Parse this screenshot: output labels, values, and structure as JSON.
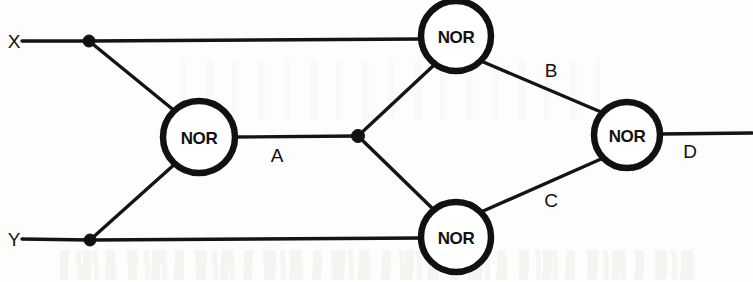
{
  "diagram": {
    "type": "logic-circuit-schematic",
    "colors": {
      "line": "#141414",
      "gate_outline": "#111111",
      "gate_fill": "#ffffff",
      "background": "#fdfdfb",
      "text": "#111111"
    },
    "inputs": [
      {
        "id": "x",
        "label": "X",
        "x": 7,
        "y": 41
      },
      {
        "id": "y",
        "label": "Y",
        "x": 7,
        "y": 239
      }
    ],
    "outputs": [
      {
        "id": "d",
        "label": "D",
        "x": 690,
        "y": 151
      }
    ],
    "gates": [
      {
        "id": "gate1",
        "label": "NOR",
        "cx": 199,
        "cy": 137,
        "r": 36
      },
      {
        "id": "gate2",
        "label": "NOR",
        "cx": 456,
        "cy": 36,
        "r": 35
      },
      {
        "id": "gate3",
        "label": "NOR",
        "cx": 456,
        "cy": 237,
        "r": 35
      },
      {
        "id": "gate4",
        "label": "NOR",
        "cx": 627,
        "cy": 135,
        "r": 33
      }
    ],
    "signal_labels": [
      {
        "id": "a",
        "label": "A",
        "x": 277,
        "y": 155
      },
      {
        "id": "b",
        "label": "B",
        "x": 551,
        "y": 70
      },
      {
        "id": "c",
        "label": "C",
        "x": 551,
        "y": 200
      },
      {
        "id": "d",
        "label": "D",
        "x": 690,
        "y": 151
      }
    ],
    "junctions": [
      {
        "id": "junction-x",
        "cx": 89,
        "cy": 41,
        "r": 6
      },
      {
        "id": "junction-y",
        "cx": 90,
        "cy": 240,
        "r": 6
      },
      {
        "id": "junction-a",
        "cx": 358,
        "cy": 136,
        "r": 6.5
      }
    ],
    "wires": [
      {
        "id": "wire-x-input",
        "d": "M 22 41 L 89 41"
      },
      {
        "id": "wire-x-to-gate2",
        "d": "M 89 41 L 421 39"
      },
      {
        "id": "wire-x-to-gate1",
        "d": "M 89 41 L 176 112"
      },
      {
        "id": "wire-y-input",
        "d": "M 22 239 L 90 240"
      },
      {
        "id": "wire-y-to-gate3",
        "d": "M 90 240 L 424 238"
      },
      {
        "id": "wire-y-to-gate1",
        "d": "M 90 240 L 176 163"
      },
      {
        "id": "wire-gate1-out-a",
        "d": "M 235 137 L 358 136"
      },
      {
        "id": "wire-a-to-gate2",
        "d": "M 358 136 L 433 66"
      },
      {
        "id": "wire-a-to-gate3",
        "d": "M 358 136 L 433 209"
      },
      {
        "id": "wire-gate2-out-b",
        "d": "M 481 61 L 601 112"
      },
      {
        "id": "wire-gate3-out-c",
        "d": "M 481 212 L 601 159"
      },
      {
        "id": "wire-gate4-out-d",
        "d": "M 660 134 L 752 133"
      }
    ]
  }
}
